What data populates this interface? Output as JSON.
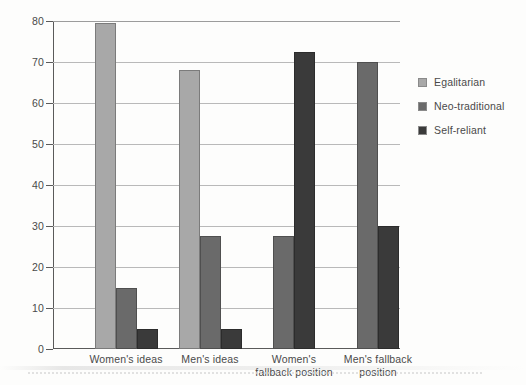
{
  "chart_data": {
    "type": "bar",
    "title": "",
    "subtitle": "",
    "xlabel": "",
    "ylabel": "",
    "ylim": [
      0,
      80
    ],
    "yticks": [
      0,
      10,
      20,
      30,
      40,
      50,
      60,
      70,
      80
    ],
    "ytick_labels": [
      "0",
      "10",
      "20",
      "30",
      "40",
      "50",
      "60",
      "70",
      "80"
    ],
    "grid": true,
    "legend_position": "right",
    "categories": [
      "Women's ideas",
      "Men's ideas",
      "Women's fallback position",
      "Men's fallback position"
    ],
    "category_lines": [
      [
        "Women's ideas"
      ],
      [
        "Men's ideas"
      ],
      [
        "Women's",
        "fallback position"
      ],
      [
        "Men's fallback",
        "position"
      ]
    ],
    "series": [
      {
        "name": "Egalitarian",
        "color": "#a8a8a8",
        "values": [
          79.5,
          68,
          null,
          null
        ]
      },
      {
        "name": "Neo-traditional",
        "color": "#6a6a6a",
        "values": [
          15,
          27.5,
          27.5,
          70
        ]
      },
      {
        "name": "Self-reliant",
        "color": "#3a3a3a",
        "values": [
          5,
          5,
          72.5,
          30
        ]
      }
    ],
    "bars": [
      {
        "category": "Women's ideas",
        "series": "Egalitarian",
        "value": 79.5
      },
      {
        "category": "Women's ideas",
        "series": "Neo-traditional",
        "value": 15
      },
      {
        "category": "Women's ideas",
        "series": "Self-reliant",
        "value": 5
      },
      {
        "category": "Men's ideas",
        "series": "Egalitarian",
        "value": 68
      },
      {
        "category": "Men's ideas",
        "series": "Neo-traditional",
        "value": 27.5
      },
      {
        "category": "Men's ideas",
        "series": "Self-reliant",
        "value": 5
      },
      {
        "category": "Women's fallback position",
        "series": "Neo-traditional",
        "value": 27.5
      },
      {
        "category": "Women's fallback position",
        "series": "Self-reliant",
        "value": 72.5
      },
      {
        "category": "Men's fallback position",
        "series": "Neo-traditional",
        "value": 70
      },
      {
        "category": "Men's fallback position",
        "series": "Self-reliant",
        "value": 30
      }
    ]
  },
  "legend": {
    "items": [
      {
        "label": "Egalitarian"
      },
      {
        "label": "Neo-traditional"
      },
      {
        "label": "Self-reliant"
      }
    ]
  }
}
